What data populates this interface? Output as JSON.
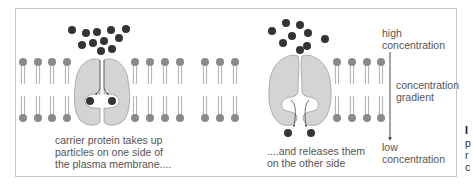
{
  "diagram": {
    "colors": {
      "frame": "#c8c8c8",
      "phospholipid_head": "#8a8a8a",
      "phospholipid_tail": "#9a9a9a",
      "protein_fill": "#d4d4d4",
      "protein_stroke": "#9d9d9d",
      "particle": "#333333",
      "arrow": "#333333",
      "text": "#555555"
    },
    "labels": {
      "left_caption_line1": "carrier protein takes up",
      "left_caption_line2": "particles on one side of",
      "left_caption_line3": "the plasma membrane....",
      "right_caption_line1": "....and releases them",
      "right_caption_line2": "on the other side",
      "high_line1": "high",
      "high_line2": "concentration",
      "gradient_line1": "concentration",
      "gradient_line2": "gradient",
      "low_line1": "low",
      "low_line2": "concentration"
    },
    "edge_text": {
      "letter_bold": "I",
      "line1": "p",
      "line2": "r",
      "line3": "c"
    },
    "lipid_heads_x": [
      23,
      38,
      52,
      67,
      135,
      150,
      165,
      180,
      205,
      220,
      235,
      337,
      352,
      367,
      381
    ],
    "left_cluster": [
      [
        72,
        30
      ],
      [
        86,
        33
      ],
      [
        97,
        32
      ],
      [
        111,
        30
      ],
      [
        126,
        29
      ],
      [
        119,
        38
      ],
      [
        104,
        41
      ],
      [
        82,
        45
      ],
      [
        93,
        43
      ],
      [
        101,
        51
      ],
      [
        112,
        49
      ]
    ],
    "left_bound": [
      [
        90,
        101
      ],
      [
        112,
        101
      ]
    ],
    "right_cluster": [
      [
        286,
        23
      ],
      [
        300,
        25
      ],
      [
        272,
        31
      ],
      [
        292,
        36
      ],
      [
        308,
        33
      ],
      [
        325,
        39
      ],
      [
        283,
        43
      ],
      [
        307,
        46
      ],
      [
        300,
        50
      ]
    ],
    "right_released": [
      [
        288,
        133
      ],
      [
        311,
        133
      ]
    ]
  }
}
